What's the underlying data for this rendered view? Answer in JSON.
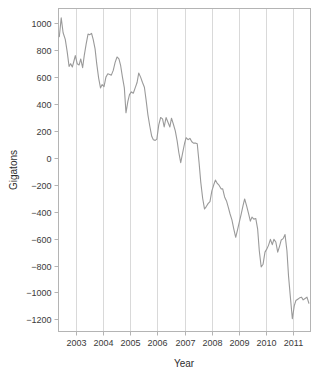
{
  "chart_data": {
    "type": "line",
    "title": "",
    "subtitle": "",
    "xlabel": "Year",
    "ylabel": "Gigatons",
    "xlim": [
      2002.35,
      2011.65
    ],
    "ylim": [
      -1290,
      1110
    ],
    "grid": "vertical gridlines at each year tick",
    "legend": "none",
    "line_color": "#9a9a9a",
    "background_color": "#ffffff",
    "frame_color": "#b4b4b4",
    "gridline_color": "#cfcfcf",
    "x_ticks": [
      2003,
      2004,
      2005,
      2006,
      2007,
      2008,
      2009,
      2010,
      2011
    ],
    "x_tick_labels": [
      "2003",
      "2004",
      "2005",
      "2006",
      "2007",
      "2008",
      "2009",
      "2010",
      "2011"
    ],
    "y_ticks": [
      1000,
      800,
      600,
      400,
      200,
      0,
      -200,
      -400,
      -600,
      -800,
      -1000,
      -1200
    ],
    "y_tick_labels": [
      "1000",
      "800",
      "600",
      "400",
      "200",
      "0",
      "−200",
      "−400",
      "−600",
      "−800",
      "−1000",
      "−1200"
    ],
    "series": [
      {
        "name": "Ice mass anomaly",
        "color": "#9a9a9a",
        "x": [
          2002.38,
          2002.45,
          2002.52,
          2002.6,
          2002.67,
          2002.74,
          2002.8,
          2002.86,
          2002.92,
          2002.97,
          2003.04,
          2003.11,
          2003.17,
          2003.24,
          2003.3,
          2003.37,
          2003.44,
          2003.5,
          2003.57,
          2003.63,
          2003.7,
          2003.76,
          2003.83,
          2003.9,
          2003.96,
          2004.03,
          2004.1,
          2004.17,
          2004.24,
          2004.3,
          2004.37,
          2004.44,
          2004.51,
          2004.58,
          2004.64,
          2004.71,
          2004.78,
          2004.84,
          2004.91,
          2004.97,
          2005.04,
          2005.11,
          2005.18,
          2005.25,
          2005.31,
          2005.38,
          2005.45,
          2005.52,
          2005.58,
          2005.65,
          2005.72,
          2005.79,
          2005.85,
          2005.92,
          2005.98,
          2006.05,
          2006.12,
          2006.19,
          2006.25,
          2006.32,
          2006.39,
          2006.46,
          2006.52,
          2006.59,
          2006.66,
          2006.73,
          2006.79,
          2006.86,
          2006.93,
          2007.0,
          2007.06,
          2007.13,
          2007.2,
          2007.27,
          2007.33,
          2007.4,
          2007.47,
          2007.54,
          2007.6,
          2007.67,
          2007.74,
          2007.81,
          2007.87,
          2007.94,
          2008.01,
          2008.08,
          2008.14,
          2008.21,
          2008.28,
          2008.35,
          2008.41,
          2008.48,
          2008.55,
          2008.62,
          2008.68,
          2008.75,
          2008.82,
          2008.89,
          2008.95,
          2009.02,
          2009.09,
          2009.16,
          2009.22,
          2009.29,
          2009.36,
          2009.43,
          2009.49,
          2009.56,
          2009.63,
          2009.7,
          2009.76,
          2009.83,
          2009.9,
          2009.97,
          2010.03,
          2010.1,
          2010.17,
          2010.24,
          2010.3,
          2010.37,
          2010.44,
          2010.51,
          2010.57,
          2010.64,
          2010.71,
          2010.78,
          2010.84,
          2010.91,
          2010.98,
          2011.05,
          2011.11,
          2011.18,
          2011.25,
          2011.32,
          2011.38,
          2011.45,
          2011.52,
          2011.59
        ],
        "y": [
          900,
          1040,
          930,
          880,
          790,
          680,
          700,
          675,
          720,
          760,
          700,
          690,
          735,
          670,
          760,
          845,
          920,
          915,
          925,
          880,
          810,
          700,
          595,
          520,
          545,
          530,
          600,
          625,
          620,
          615,
          650,
          710,
          750,
          735,
          690,
          600,
          520,
          335,
          420,
          470,
          490,
          480,
          520,
          560,
          630,
          600,
          560,
          525,
          435,
          320,
          235,
          160,
          135,
          130,
          140,
          245,
          300,
          290,
          230,
          300,
          265,
          230,
          295,
          250,
          200,
          125,
          40,
          -35,
          35,
          105,
          150,
          135,
          145,
          120,
          110,
          110,
          105,
          -40,
          -180,
          -300,
          -380,
          -360,
          -340,
          -325,
          -245,
          -200,
          -165,
          -190,
          -205,
          -230,
          -230,
          -290,
          -320,
          -370,
          -415,
          -460,
          -530,
          -590,
          -540,
          -480,
          -420,
          -355,
          -305,
          -355,
          -410,
          -470,
          -440,
          -455,
          -450,
          -530,
          -690,
          -810,
          -790,
          -700,
          -680,
          -650,
          -605,
          -645,
          -605,
          -625,
          -700,
          -655,
          -610,
          -600,
          -570,
          -690,
          -880,
          -1040,
          -1195,
          -1100,
          -1060,
          -1050,
          -1040,
          -1035,
          -1055,
          -1045,
          -1035,
          -1080
        ]
      }
    ]
  },
  "axes": {
    "x_title": "Year",
    "y_title": "Gigatons"
  }
}
